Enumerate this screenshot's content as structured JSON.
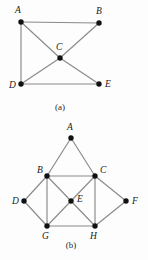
{
  "figure": {
    "background_color": "#fdfdfd",
    "edge_color": "#8a8a8a",
    "vertex_color": "#111111",
    "label_color": "#1a1a1a",
    "vertex_radius": 2.7,
    "graphs": [
      {
        "id": "graph-a",
        "caption": "(a)",
        "caption_x": 60,
        "caption_y": 110,
        "vertices": [
          {
            "id": "A",
            "label": "A",
            "x": 21,
            "y": 22,
            "label_x": 15,
            "label_y": 13
          },
          {
            "id": "B",
            "label": "B",
            "x": 99,
            "y": 23,
            "label_x": 96,
            "label_y": 14
          },
          {
            "id": "C",
            "label": "C",
            "x": 60,
            "y": 58,
            "label_x": 56,
            "label_y": 50
          },
          {
            "id": "D",
            "label": "D",
            "x": 21,
            "y": 84,
            "label_x": 9,
            "label_y": 88
          },
          {
            "id": "E",
            "label": "E",
            "x": 99,
            "y": 84,
            "label_x": 105,
            "label_y": 87
          }
        ],
        "edges": [
          {
            "from": "A",
            "to": "B"
          },
          {
            "from": "A",
            "to": "D"
          },
          {
            "from": "A",
            "to": "C"
          },
          {
            "from": "B",
            "to": "C"
          },
          {
            "from": "C",
            "to": "D"
          },
          {
            "from": "C",
            "to": "E"
          },
          {
            "from": "D",
            "to": "E"
          }
        ]
      },
      {
        "id": "graph-b",
        "caption": "(b)",
        "caption_x": 71,
        "caption_y": 248,
        "vertices": [
          {
            "id": "A",
            "label": "A",
            "x": 71,
            "y": 138,
            "label_x": 67,
            "label_y": 130
          },
          {
            "id": "B",
            "label": "B",
            "x": 47,
            "y": 176,
            "label_x": 37,
            "label_y": 173
          },
          {
            "id": "C",
            "label": "C",
            "x": 95,
            "y": 176,
            "label_x": 100,
            "label_y": 173
          },
          {
            "id": "D",
            "label": "D",
            "x": 24,
            "y": 201,
            "label_x": 12,
            "label_y": 204
          },
          {
            "id": "E",
            "label": "E",
            "x": 71,
            "y": 201,
            "label_x": 77,
            "label_y": 202
          },
          {
            "id": "F",
            "label": "F",
            "x": 126,
            "y": 201,
            "label_x": 132,
            "label_y": 204
          },
          {
            "id": "G",
            "label": "G",
            "x": 47,
            "y": 226,
            "label_x": 42,
            "label_y": 239
          },
          {
            "id": "H",
            "label": "H",
            "x": 95,
            "y": 226,
            "label_x": 90,
            "label_y": 239
          }
        ],
        "edges": [
          {
            "from": "A",
            "to": "B"
          },
          {
            "from": "A",
            "to": "C"
          },
          {
            "from": "B",
            "to": "C"
          },
          {
            "from": "B",
            "to": "D"
          },
          {
            "from": "B",
            "to": "G"
          },
          {
            "from": "B",
            "to": "E"
          },
          {
            "from": "C",
            "to": "E"
          },
          {
            "from": "C",
            "to": "F"
          },
          {
            "from": "C",
            "to": "H"
          },
          {
            "from": "D",
            "to": "G"
          },
          {
            "from": "E",
            "to": "G"
          },
          {
            "from": "E",
            "to": "H"
          },
          {
            "from": "F",
            "to": "H"
          },
          {
            "from": "G",
            "to": "H"
          }
        ]
      }
    ]
  }
}
